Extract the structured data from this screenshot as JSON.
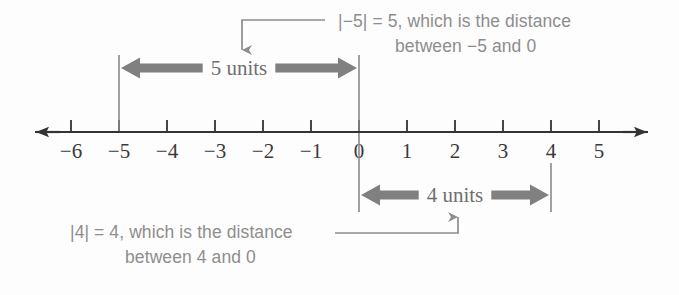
{
  "figure": {
    "type": "number-line-diagram",
    "background_color": "#fdfdfd",
    "axis_color": "#333333",
    "annotation_color": "#8d8d8d",
    "measure_color": "#808080",
    "tick_label_color": "#3a3a3a"
  },
  "number_line": {
    "ticks": [
      {
        "label": "−6",
        "value": -6,
        "x": 71
      },
      {
        "label": "−5",
        "value": -5,
        "x": 119
      },
      {
        "label": "−4",
        "value": -4,
        "x": 167
      },
      {
        "label": "−3",
        "value": -3,
        "x": 215
      },
      {
        "label": "−2",
        "value": -2,
        "x": 263
      },
      {
        "label": "−1",
        "value": -1,
        "x": 311
      },
      {
        "label": "0",
        "value": 0,
        "x": 359
      },
      {
        "label": "1",
        "value": 1,
        "x": 407
      },
      {
        "label": "2",
        "value": 2,
        "x": 455
      },
      {
        "label": "3",
        "value": 3,
        "x": 503
      },
      {
        "label": "4",
        "value": 4,
        "x": 551
      },
      {
        "label": "5",
        "value": 5,
        "x": 599
      }
    ],
    "axis_y": 132,
    "left_arrow_x": 22,
    "right_arrow_x": 660
  },
  "measures": {
    "top": {
      "label": "5 units",
      "from_value": -5,
      "to_value": 0,
      "from_x": 119,
      "to_x": 359,
      "arrow_y": 68,
      "guide_top_y": 55
    },
    "bottom": {
      "label": "4 units",
      "from_value": 0,
      "to_value": 4,
      "from_x": 359,
      "to_x": 551,
      "arrow_y": 195,
      "guide_bottom_y": 212
    }
  },
  "annotations": {
    "top": {
      "line1": "|−5| = 5, which is the distance",
      "line2": "between −5 and 0",
      "line1_x": 338,
      "line1_y": 27,
      "line2_x": 395,
      "line2_y": 52
    },
    "bottom": {
      "line1": "|4| = 4, which is the distance",
      "line2": "between 4 and 0",
      "line1_x": 70,
      "line1_y": 238,
      "line2_x": 125,
      "line2_y": 263
    }
  }
}
